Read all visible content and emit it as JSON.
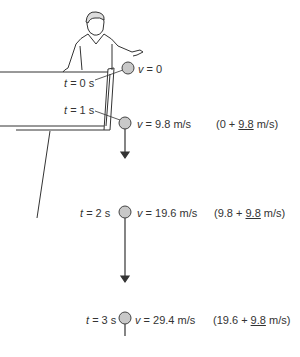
{
  "diagram": {
    "title": "",
    "colors": {
      "ball_fill": "#c8c8c8",
      "line": "#333333"
    },
    "points": [
      {
        "t_label": "t",
        "t_value": "= 0 s",
        "v_label": "v",
        "v_value": "= 0",
        "calc": ""
      },
      {
        "t_label": "t",
        "t_value": "= 1 s",
        "v_label": "v",
        "v_value": "= 9.8 m/s",
        "calc_open": "(0 + ",
        "calc_inc": "9.8",
        "calc_close": " m/s)"
      },
      {
        "t_label": "t",
        "t_value": "= 2 s",
        "v_label": "v",
        "v_value": "= 19.6 m/s",
        "calc_open": "(9.8 + ",
        "calc_inc": "9.8",
        "calc_close": " m/s)"
      },
      {
        "t_label": "t",
        "t_value": "= 3 s",
        "v_label": "v",
        "v_value": "= 29.4 m/s",
        "calc_open": "(19.6 + ",
        "calc_inc": "9.8",
        "calc_close": " m/s)"
      }
    ]
  }
}
